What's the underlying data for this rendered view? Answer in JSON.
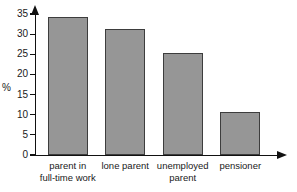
{
  "chart_data": {
    "type": "bar",
    "title": "",
    "xlabel": "",
    "ylabel": "%",
    "categories": [
      "parent in\nfull-time work",
      "lone parent",
      "unemployed\nparent",
      "pensioner"
    ],
    "values": [
      34.2,
      31.2,
      25.3,
      10.7
    ],
    "ylim": [
      0,
      35
    ],
    "yticks": [
      0,
      5,
      10,
      15,
      20,
      25,
      30,
      35
    ],
    "ytick_labels": [
      "0",
      "5",
      "10",
      "15",
      "20",
      "25",
      "30",
      "35"
    ],
    "grid": false,
    "legend": null,
    "bar_color": "#969696",
    "bar_edge_color": "#3d3d3d",
    "axis_color": "#111111"
  },
  "axes": {
    "y_unit_label": "%",
    "y_arrow": "arrow-up-icon",
    "x_arrow": "arrow-right-icon"
  }
}
